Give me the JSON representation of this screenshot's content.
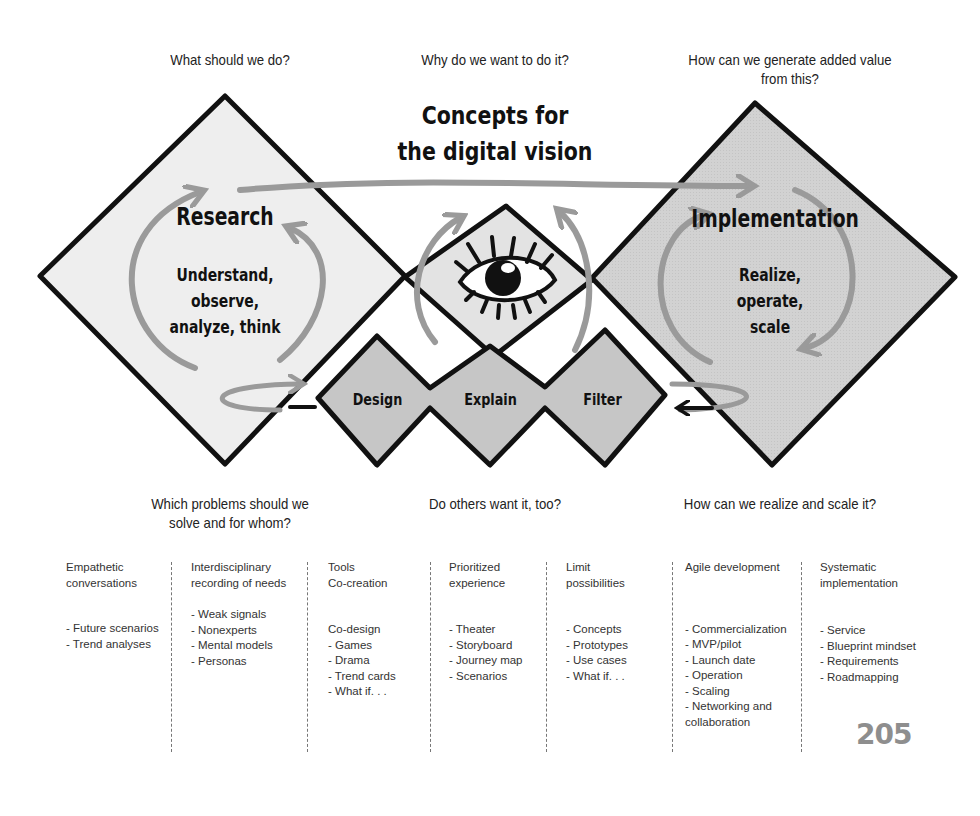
{
  "questions": {
    "top_left": "What should we do?",
    "top_center": "Why do we want to do it?",
    "top_right_line1": "How can we generate added value",
    "top_right_line2": "from this?",
    "bottom_left_line1": "Which problems should we",
    "bottom_left_line2": "solve and for whom?",
    "bottom_center": "Do others want it, too?",
    "bottom_right": "How can we realize and scale it?"
  },
  "title": {
    "line1": "Concepts for",
    "line2": "the digital vision"
  },
  "research": {
    "title": "Research",
    "line1": "Understand,",
    "line2": "observe,",
    "line3": "analyze, think"
  },
  "implementation": {
    "title": "Implementation",
    "line1": "Realize,",
    "line2": "operate,",
    "line3": "scale"
  },
  "concept_steps": [
    {
      "label": "Design"
    },
    {
      "label": "Explain"
    },
    {
      "label": "Filter"
    }
  ],
  "icons": {
    "center": "eye-icon",
    "cycle": "circular-arrow-icon"
  },
  "colors": {
    "outline": "#111111",
    "research_fill": "#eeeeee",
    "vision_fill": "#e3e3e3",
    "implementation_fill": "#d4d4d4",
    "steps_fill": "#c6c6c6",
    "arrow_gray": "#9a9a9a",
    "page_number": "#8e8e8e"
  },
  "columns": [
    {
      "heading": "Empathetic\nconversations",
      "items": [
        "- Future scenarios",
        "- Trend analyses"
      ]
    },
    {
      "heading": "Interdisciplinary\nrecording of needs",
      "items": [
        "- Weak signals",
        "- Nonexperts",
        "- Mental models",
        "- Personas"
      ]
    },
    {
      "heading": "Tools\nCo-creation",
      "items": [
        "Co-design",
        "- Games",
        "- Drama",
        "- Trend cards",
        "- What if. . ."
      ]
    },
    {
      "heading": "Prioritized\nexperience",
      "items": [
        "- Theater",
        "- Storyboard",
        "- Journey map",
        "- Scenarios"
      ]
    },
    {
      "heading": "Limit\npossibilities",
      "items": [
        "- Concepts",
        "- Prototypes",
        "- Use cases",
        "- What if. . ."
      ]
    },
    {
      "heading": "Agile development",
      "items": [
        "- Commercialization",
        "- MVP/pilot",
        "- Launch date",
        "- Operation",
        "- Scaling",
        "- Networking and\n  collaboration"
      ]
    },
    {
      "heading": "Systematic\nimplementation",
      "items": [
        "- Service",
        "- Blueprint mindset",
        "- Requirements",
        "- Roadmapping"
      ]
    }
  ],
  "page_number": "205"
}
